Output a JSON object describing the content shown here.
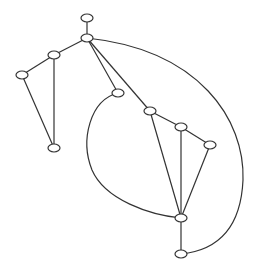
{
  "diagram": {
    "type": "undirected-graph",
    "style": {
      "stroke": "#333333",
      "node_fill": "#ffffff",
      "background": "#ffffff"
    },
    "nodes": [
      {
        "id": "n_top",
        "x": 87,
        "y": 18,
        "rx": 6,
        "ry": 4
      },
      {
        "id": "n_hub",
        "x": 87,
        "y": 38,
        "rx": 6,
        "ry": 4
      },
      {
        "id": "n_a",
        "x": 54,
        "y": 55,
        "rx": 6,
        "ry": 4
      },
      {
        "id": "n_b",
        "x": 22,
        "y": 75,
        "rx": 6,
        "ry": 4
      },
      {
        "id": "n_c",
        "x": 54,
        "y": 148,
        "rx": 6,
        "ry": 4
      },
      {
        "id": "n_d",
        "x": 118,
        "y": 93,
        "rx": 6,
        "ry": 4
      },
      {
        "id": "n_e",
        "x": 150,
        "y": 111,
        "rx": 6,
        "ry": 4
      },
      {
        "id": "n_f",
        "x": 181,
        "y": 127,
        "rx": 6,
        "ry": 4
      },
      {
        "id": "n_g",
        "x": 210,
        "y": 145,
        "rx": 6,
        "ry": 4
      },
      {
        "id": "n_h",
        "x": 181,
        "y": 218,
        "rx": 6,
        "ry": 4
      },
      {
        "id": "n_i",
        "x": 181,
        "y": 254,
        "rx": 6,
        "ry": 4
      }
    ],
    "edges": [
      {
        "id": "e_top_hub",
        "d": "M87,22 L87,34"
      },
      {
        "id": "e_hub_a",
        "d": "M87,38 L54,55"
      },
      {
        "id": "e_a_b",
        "d": "M54,55 L22,75"
      },
      {
        "id": "e_a_c",
        "d": "M54,55 L54,148"
      },
      {
        "id": "e_b_c",
        "d": "M22,75 L54,148"
      },
      {
        "id": "e_hub_d",
        "d": "M87,38 L118,93"
      },
      {
        "id": "e_hub_e",
        "d": "M87,38 L150,111"
      },
      {
        "id": "e_e_f",
        "d": "M150,111 L181,127"
      },
      {
        "id": "e_f_g",
        "d": "M181,127 L210,145"
      },
      {
        "id": "e_e_h",
        "d": "M150,111 L181,218"
      },
      {
        "id": "e_f_h",
        "d": "M181,127 L181,218"
      },
      {
        "id": "e_g_h",
        "d": "M210,145 L181,218"
      },
      {
        "id": "e_h_i",
        "d": "M181,218 L181,254"
      },
      {
        "id": "e_d_h",
        "d": "M118,93 C90,100 80,140 92,170 C105,200 150,215 181,218"
      },
      {
        "id": "e_hub_i",
        "d": "M87,38 C200,50 245,120 243,180 C241,225 220,250 181,254"
      }
    ]
  }
}
